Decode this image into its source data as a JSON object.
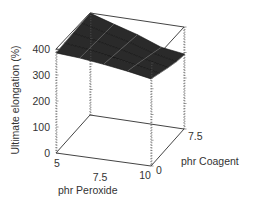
{
  "chart_data": {
    "type": "surface3d",
    "title": "",
    "xlabel": "phr Peroxide",
    "ylabel": "phr Coagent",
    "zlabel": "Ultimate elongation (%)",
    "x_ticks": [
      "5",
      "7.5",
      "10"
    ],
    "y_ticks": [
      "0",
      "7.5"
    ],
    "z_ticks": [
      "0",
      "100",
      "200",
      "300",
      "400"
    ],
    "xlim": [
      5,
      10
    ],
    "ylim": [
      0,
      7.5
    ],
    "zlim": [
      0,
      400
    ],
    "grid": false,
    "box": true,
    "x": [
      5,
      6.25,
      7.5,
      8.75,
      10
    ],
    "y": [
      0,
      1.875,
      3.75,
      5.625,
      7.5
    ],
    "z": [
      [
        385,
        386,
        388,
        390,
        392
      ],
      [
        378,
        374,
        370,
        366,
        362
      ],
      [
        366,
        358,
        350,
        342,
        334
      ],
      [
        352,
        340,
        326,
        312,
        298
      ],
      [
        335,
        320,
        305,
        292,
        284
      ]
    ],
    "z_note": "z[i][j] = elongation at x[i] (peroxide), y[j] (coagent); estimated from rendering"
  },
  "labels": {
    "z_axis_title": "Ultimate elongation (%)",
    "x_axis_title": "phr Peroxide",
    "y_axis_title": "phr Coagent",
    "z_ticks": [
      "400",
      "300",
      "200",
      "100",
      "0"
    ],
    "x_ticks": [
      "5",
      "7.5",
      "10"
    ],
    "y_ticks": [
      "0",
      "7.5"
    ]
  }
}
